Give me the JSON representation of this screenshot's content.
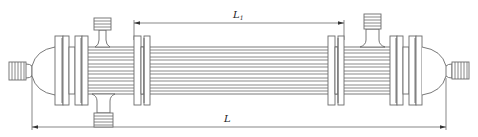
{
  "figure": {
    "type": "engineering-drawing",
    "colors": {
      "line": "#6a6a6a",
      "tube": "#8a8a8a",
      "dimension": "#555555",
      "text": "#222222",
      "background": "#ffffff"
    }
  },
  "dimensions": {
    "L1": {
      "label": "L",
      "subscript": "1",
      "description": "distance between inner tube-sheet flanges"
    },
    "L": {
      "label": "L",
      "subscript": "",
      "description": "overall length between end connections"
    }
  },
  "components": {
    "left_end_connection": "threaded-nozzle",
    "left_head": "hemispherical-head",
    "left_flanges": 2,
    "left_shell_nozzles": [
      "top-threaded-nozzle",
      "bottom-threaded-nozzle"
    ],
    "tube_bundle_lines": 12,
    "right_flanges": 2,
    "right_shell_nozzles": [
      "top-threaded-nozzle"
    ],
    "right_head": "hemispherical-head",
    "right_end_connection": "threaded-nozzle"
  }
}
